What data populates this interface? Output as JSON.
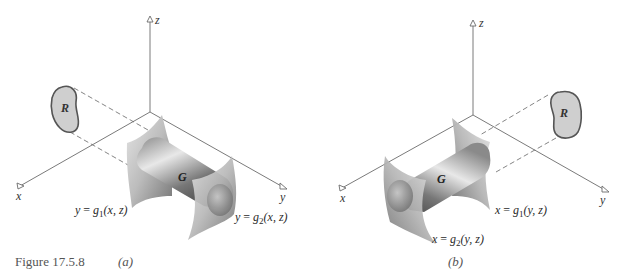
{
  "figure": {
    "caption": "Figure 17.5.8",
    "panels": [
      {
        "id": "a",
        "label": "(a)",
        "axes": {
          "x": "x",
          "y": "y",
          "z": "z"
        },
        "region_label": "R",
        "solid_label": "G",
        "surface_lower": {
          "var": "y",
          "fn": "g",
          "sub": "1",
          "args": "(x, z)"
        },
        "surface_upper": {
          "var": "y",
          "fn": "g",
          "sub": "2",
          "args": "(x, z)"
        },
        "projection_plane": "xz-plane"
      },
      {
        "id": "b",
        "label": "(b)",
        "axes": {
          "x": "x",
          "y": "y",
          "z": "z"
        },
        "region_label": "R",
        "solid_label": "G",
        "surface_lower": {
          "var": "x",
          "fn": "g",
          "sub": "1",
          "args": "(y, z)"
        },
        "surface_upper": {
          "var": "x",
          "fn": "g",
          "sub": "2",
          "args": "(y, z)"
        },
        "projection_plane": "yz-plane"
      }
    ]
  },
  "colors": {
    "axis": "#6b6b6b",
    "region_fill": "#cfcfcf",
    "region_stroke": "#555555",
    "surface_light": "#d9d9d9",
    "surface_dark": "#7a7a7a",
    "cylinder_dark": "#5a5a5a"
  }
}
